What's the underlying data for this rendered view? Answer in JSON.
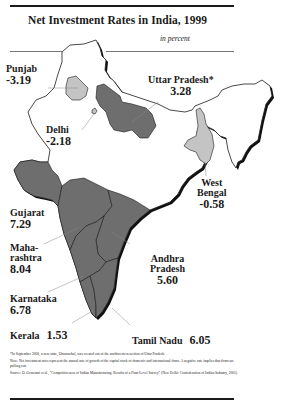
{
  "title": "Net Investment Rates in India, 1999",
  "subtitle": "in percent",
  "colors": {
    "high": "#6e6e6e",
    "negative": "#c4c4c4",
    "other": "#ffffff",
    "outline": "#1a1a1a",
    "shadow": "#111111"
  },
  "legend_note": "Darker shading = positive rate; lighter shading = negative rate",
  "states": [
    {
      "name": "Punjab",
      "value": "-3.19"
    },
    {
      "name": "Uttar Pradesh*",
      "value": "3.28"
    },
    {
      "name": "Delhi",
      "value": "-2.18"
    },
    {
      "name": "West Bengal",
      "name_lines": [
        "West",
        "Bengal"
      ],
      "value": "-0.58"
    },
    {
      "name": "Gujarat",
      "value": "7.29"
    },
    {
      "name": "Maharashtra",
      "name_lines": [
        "Maha-",
        "rashtra"
      ],
      "value": "8.04"
    },
    {
      "name": "Andhra Pradesh",
      "name_lines": [
        "Andhra",
        "Pradesh"
      ],
      "value": "5.60"
    },
    {
      "name": "Karnataka",
      "value": "6.78"
    },
    {
      "name": "Kerala",
      "value": "1.53"
    },
    {
      "name": "Tamil Nadu",
      "value": "6.05"
    }
  ],
  "footnotes": {
    "asterisk": "*In September 2000, a new state, Uttaranchal, was created out of the northwestern section of Uttar Pradesh.",
    "note": "Note: Net investment rates represent the annual rate of growth of the capital stock of domestic and international firms. A negative rate implies that firms are pulling out.",
    "source": "Source: O. Goswami et al., \"Competitiveness of Indian Manufacturing: Results of a Firm-Level Survey\" (New Delhi: Confederation of Indian Industry, 2001)."
  }
}
